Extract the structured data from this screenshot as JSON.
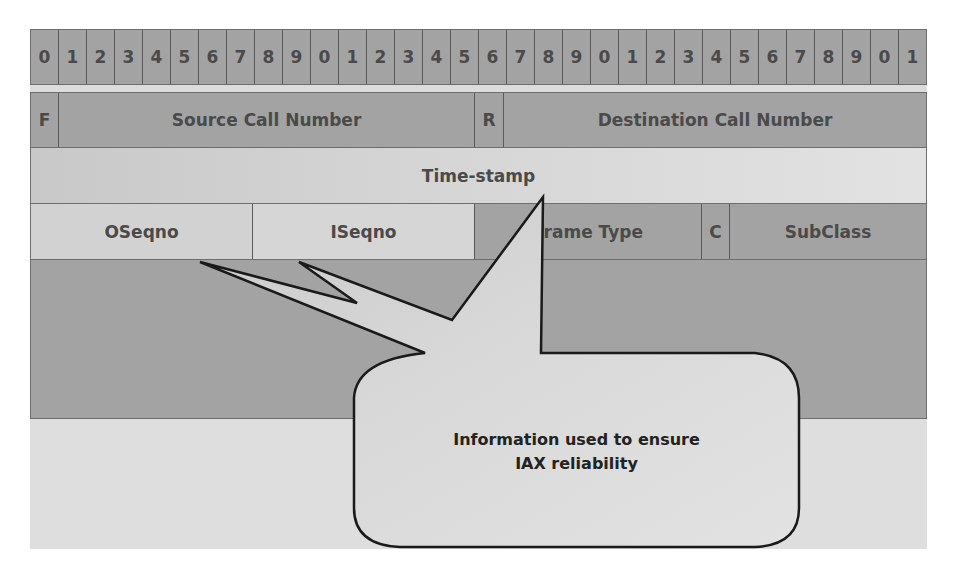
{
  "diagram": {
    "bit_labels": [
      "0",
      "1",
      "2",
      "3",
      "4",
      "5",
      "6",
      "7",
      "8",
      "9",
      "0",
      "1",
      "2",
      "3",
      "4",
      "5",
      "6",
      "7",
      "8",
      "9",
      "0",
      "1",
      "2",
      "3",
      "4",
      "5",
      "6",
      "7",
      "8",
      "9",
      "0",
      "1"
    ],
    "rows": [
      {
        "fields": [
          {
            "label": "F",
            "bits": 1
          },
          {
            "label": "Source Call Number",
            "bits": 15
          },
          {
            "label": "R",
            "bits": 1
          },
          {
            "label": "Destination Call Number",
            "bits": 15
          }
        ]
      },
      {
        "fields": [
          {
            "label": "Time-stamp",
            "bits": 32
          }
        ]
      },
      {
        "fields": [
          {
            "label": "OSeqno",
            "bits": 8
          },
          {
            "label": "ISeqno",
            "bits": 8
          },
          {
            "label": "Frame Type",
            "bits": 8
          },
          {
            "label": "C",
            "bits": 1
          },
          {
            "label": "SubClass",
            "bits": 7
          }
        ]
      }
    ],
    "callout": {
      "line1": "Information used to ensure",
      "line2": "IAX reliability",
      "points_to": [
        "OSeqno",
        "ISeqno",
        "Time-stamp"
      ]
    },
    "colors": {
      "dark_cell": "#a3a3a3",
      "light_cell": "#d8d8d8",
      "callout_fill": "#d9d9d9",
      "outline": "#1a1a1a",
      "text": "#4a4a4a"
    }
  }
}
